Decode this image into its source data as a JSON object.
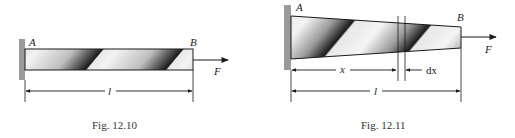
{
  "figures": [
    {
      "caption": "Fig. 12.10",
      "labels": {
        "end_a": "A",
        "end_b": "B",
        "force": "F",
        "length": "l"
      },
      "description": "Uniform bar fixed at wall, axial force F at end B"
    },
    {
      "caption": "Fig. 12.11",
      "labels": {
        "end_a": "A",
        "end_b": "B",
        "force": "F",
        "length": "l",
        "position": "x",
        "element": "dx"
      },
      "description": "Tapered bar fixed at wall, axial force F at end B, element dx at distance x"
    }
  ],
  "colors": {
    "wall": "#9a9a9a",
    "line": "#1a1a1a",
    "shade_dark": "#111111",
    "shade_light": "#f4f4f4"
  }
}
